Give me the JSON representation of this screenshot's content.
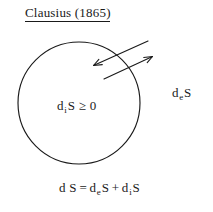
{
  "figure": {
    "title": "Clausius  (1865)",
    "title_underlined": true,
    "background_color": "#ffffff",
    "ink_color": "#1a1a1a"
  },
  "diagram": {
    "system_boundary": {
      "shape": "circle",
      "center_x": 79,
      "center_y": 103,
      "radius": 61
    },
    "inner_label": {
      "prefix": "d",
      "subscript": "i",
      "suffix": "S ≥ 0",
      "full_text": "d iS ≥ 0"
    },
    "outer_label": {
      "prefix": "d",
      "subscript": "e",
      "suffix": "S",
      "full_text": "d eS"
    },
    "arrows": [
      {
        "name": "entropy-flow-in-arrow",
        "direction": "inward",
        "from_x": 148,
        "from_y": 41,
        "to_x": 92,
        "to_y": 66
      },
      {
        "name": "entropy-flow-out-arrow",
        "direction": "outward",
        "from_x": 104,
        "from_y": 79,
        "to_x": 154,
        "to_y": 56
      }
    ]
  },
  "equation": {
    "lhs": "d S",
    "operator_equals": "=",
    "term1_prefix": "d",
    "term1_subscript": "e",
    "term1_suffix": "S",
    "operator_plus": "+",
    "term2_prefix": "d",
    "term2_subscript": "i",
    "term2_suffix": "S",
    "full_text": "d S = d eS + d iS"
  }
}
